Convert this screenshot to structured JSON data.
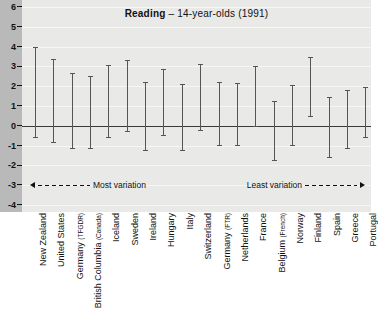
{
  "chart_data": {
    "type": "bar",
    "subtype": "range-bar",
    "title_bold": "Reading",
    "title_rest": " – 14-year-olds (1991)",
    "title": "Reading – 14-year-olds (1991)",
    "xlabel": "",
    "ylabel": "",
    "ylim": [
      -4,
      6
    ],
    "yticks": [
      6,
      5,
      4,
      3,
      2,
      1,
      0,
      -1,
      -2,
      -3,
      -4
    ],
    "ytick_labels": [
      "6",
      "5",
      "4",
      "3",
      "2",
      "1",
      "0",
      "-1",
      "-2",
      "-3",
      "-4"
    ],
    "grid": true,
    "legend": "none",
    "annotations": [
      {
        "name": "most-variation",
        "text": "Most variation",
        "position": "bottom-left",
        "arrow": "left"
      },
      {
        "name": "least-variation",
        "text": "Least variation",
        "position": "bottom-right",
        "arrow": "right"
      }
    ],
    "categories": [
      "New Zealand",
      "United States",
      "Germany (TFGDR)",
      "British Columbia (Canada)",
      "Iceland",
      "Sweden",
      "Ireland",
      "Hungary",
      "Italy",
      "Switzerland",
      "Germany (FTR)",
      "Netherlands",
      "France",
      "Belgium (French)",
      "Norway",
      "Finland",
      "Spain",
      "Greece",
      "Portugal"
    ],
    "category_parts": [
      {
        "main": "New Zealand",
        "sub": ""
      },
      {
        "main": "United States",
        "sub": ""
      },
      {
        "main": "Germany ",
        "sub": "(TFGDR)"
      },
      {
        "main": "British Columbia ",
        "sub": "(Canada)"
      },
      {
        "main": "Iceland",
        "sub": ""
      },
      {
        "main": "Sweden",
        "sub": ""
      },
      {
        "main": "Ireland",
        "sub": ""
      },
      {
        "main": "Hungary",
        "sub": ""
      },
      {
        "main": "Italy",
        "sub": ""
      },
      {
        "main": "Switzerland",
        "sub": ""
      },
      {
        "main": "Germany ",
        "sub": "(FTR)"
      },
      {
        "main": "Netherlands",
        "sub": ""
      },
      {
        "main": "France",
        "sub": ""
      },
      {
        "main": "Belgium ",
        "sub": "(French)"
      },
      {
        "main": "Norway",
        "sub": ""
      },
      {
        "main": "Finland",
        "sub": ""
      },
      {
        "main": "Spain",
        "sub": ""
      },
      {
        "main": "Greece",
        "sub": ""
      },
      {
        "main": "Portugal",
        "sub": ""
      }
    ],
    "series": [
      {
        "name": "upper",
        "values": [
          4.0,
          3.35,
          2.65,
          2.5,
          3.05,
          3.3,
          2.2,
          2.85,
          2.1,
          3.1,
          2.2,
          2.15,
          3.0,
          1.25,
          2.05,
          3.5,
          1.45,
          1.8,
          1.95
        ]
      },
      {
        "name": "lower",
        "values": [
          -0.55,
          -0.8,
          -1.1,
          -1.1,
          -0.55,
          -0.25,
          -1.2,
          -0.45,
          -1.2,
          -0.2,
          -0.95,
          -0.95,
          0.0,
          -1.75,
          -0.95,
          0.5,
          -1.6,
          -1.1,
          -0.55
        ]
      }
    ],
    "colors": {
      "bar": "#555555",
      "plot_background": "#e9e9e7",
      "axis_band": "#b9b9b9",
      "zero_line": "#3a3a3a",
      "grid_line": "#f6f6f4",
      "text": "#111111"
    }
  }
}
